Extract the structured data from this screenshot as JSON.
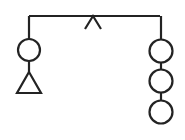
{
  "figure": {
    "title": "Balance beam mobile diagram",
    "background_color": "#ffffff",
    "stroke_color": "#232323",
    "stroke_width": 2.2,
    "width": 185,
    "height": 140
  },
  "beam": {
    "name": "horizontal beam",
    "left_x": 29,
    "right_x": 160,
    "y": 16
  },
  "fulcrum": {
    "name": "caret fulcrum",
    "shape": "inverted-v",
    "apex_x": 93,
    "apex_y": 16,
    "left_foot_x": 85,
    "left_foot_y": 29,
    "right_foot_x": 101,
    "right_foot_y": 29
  },
  "left_arm": {
    "name": "left hanger",
    "x": 29,
    "drop_top_y": 16,
    "drop_bottom_y": 39,
    "nodes": [
      {
        "name": "left-circle",
        "shape": "circle",
        "cx": 29,
        "cy": 50,
        "r": 11
      },
      {
        "name": "left-triangle",
        "shape": "triangle",
        "apex_x": 29,
        "apex_y": 72,
        "base_left_x": 17,
        "base_right_x": 41,
        "base_y": 93
      }
    ],
    "connector": {
      "x": 29,
      "top_y": 61,
      "bottom_y": 72
    }
  },
  "right_arm": {
    "name": "right hanger",
    "x": 161,
    "drop_top_y": 16,
    "drop_bottom_y": 39,
    "nodes": [
      {
        "name": "right-circle-1",
        "shape": "circle",
        "cx": 161,
        "cy": 51,
        "r": 11.5
      },
      {
        "name": "right-circle-2",
        "shape": "circle",
        "cx": 161,
        "cy": 81,
        "r": 11.5
      },
      {
        "name": "right-circle-3",
        "shape": "circle",
        "cx": 161,
        "cy": 112,
        "r": 11.5
      }
    ],
    "connectors": [
      {
        "x": 161,
        "top_y": 62,
        "bottom_y": 70
      },
      {
        "x": 161,
        "top_y": 92,
        "bottom_y": 100
      }
    ]
  },
  "counts": {
    "left_circles": 1,
    "left_triangles": 1,
    "right_circles": 3
  }
}
